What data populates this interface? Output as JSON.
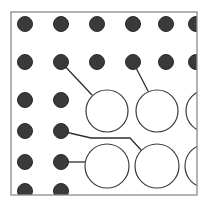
{
  "diagram": {
    "colors": {
      "background": "#ffffff",
      "frame": "#8a8a8a",
      "dot_fill": "#3a3a3a",
      "dot_stroke": "#2a2a2a",
      "circle_stroke": "#3c3c3c",
      "line": "#2e2e2e"
    },
    "frame": {
      "x": 11,
      "y": 12,
      "width": 186,
      "height": 183
    },
    "dot_radius": 7.5,
    "dots": [
      {
        "x": 25,
        "y": 24
      },
      {
        "x": 61,
        "y": 24
      },
      {
        "x": 97,
        "y": 24
      },
      {
        "x": 133,
        "y": 24
      },
      {
        "x": 166,
        "y": 24
      },
      {
        "x": 196,
        "y": 24
      },
      {
        "x": 25,
        "y": 62
      },
      {
        "x": 61,
        "y": 62
      },
      {
        "x": 97,
        "y": 62
      },
      {
        "x": 133,
        "y": 62
      },
      {
        "x": 166,
        "y": 62
      },
      {
        "x": 196,
        "y": 62
      },
      {
        "x": 25,
        "y": 100
      },
      {
        "x": 61,
        "y": 100
      },
      {
        "x": 25,
        "y": 131
      },
      {
        "x": 61,
        "y": 131
      },
      {
        "x": 25,
        "y": 162
      },
      {
        "x": 61,
        "y": 162
      },
      {
        "x": 25,
        "y": 191
      },
      {
        "x": 61,
        "y": 191
      }
    ],
    "circles": [
      {
        "cx": 107,
        "cy": 111,
        "r": 21
      },
      {
        "cx": 157,
        "cy": 111,
        "r": 21
      },
      {
        "cx": 207,
        "cy": 111,
        "r": 21
      },
      {
        "cx": 107,
        "cy": 166,
        "r": 22
      },
      {
        "cx": 157,
        "cy": 166,
        "r": 22
      },
      {
        "cx": 207,
        "cy": 166,
        "r": 22
      }
    ],
    "connectors": [
      {
        "points": "61,62 92,95"
      },
      {
        "points": "133,62 148,91"
      },
      {
        "points": "61,131 91,138 130,138 141,150"
      },
      {
        "points": "61,162 85,162"
      }
    ]
  }
}
